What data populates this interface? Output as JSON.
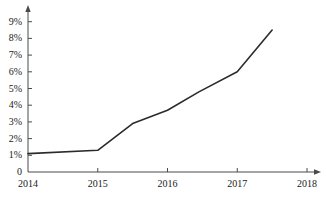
{
  "chart_data": {
    "type": "line",
    "title": "",
    "subtitle": "",
    "xlabel": "",
    "ylabel": "",
    "x": [
      2014.0,
      2015.0,
      2015.5,
      2016.0,
      2016.45,
      2017.0,
      2017.5
    ],
    "values": [
      1.1,
      1.3,
      2.9,
      3.7,
      4.8,
      6.0,
      8.5
    ],
    "series": [
      {
        "name": "",
        "x": [
          2014.0,
          2015.0,
          2015.5,
          2016.0,
          2016.45,
          2017.0,
          2017.5
        ],
        "values": [
          1.1,
          1.3,
          2.9,
          3.7,
          4.8,
          6.0,
          8.5
        ]
      }
    ],
    "xlim": [
      2014,
      2018
    ],
    "ylim": [
      0,
      9.5
    ],
    "xticks": [
      2014,
      2015,
      2016,
      2017,
      2018
    ],
    "xtick_labels": [
      "2014",
      "2015",
      "2016",
      "2017",
      "2018"
    ],
    "yticks": [
      0,
      1,
      2,
      3,
      4,
      5,
      6,
      7,
      8,
      9
    ],
    "ytick_labels": [
      "0",
      "1%",
      "2%",
      "3%",
      "4%",
      "5%",
      "6%",
      "7%",
      "8%",
      "9%"
    ],
    "grid": false,
    "legend": null,
    "legend_position": "none",
    "annotations": [],
    "line_color": "#2b2b2b",
    "axis_color": "#4a4a4a",
    "background_color": "#ffffff"
  },
  "axes": {
    "y_axis_name": "percentage-axis",
    "x_axis_name": "year-axis",
    "arrow_x": "arrow-right",
    "arrow_y": "arrow-up"
  }
}
